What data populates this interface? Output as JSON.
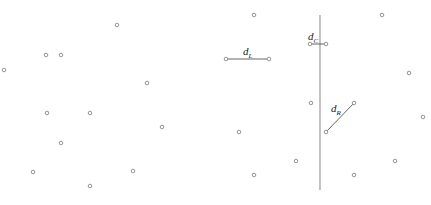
{
  "diagram": {
    "type": "closest-pair-divide-and-conquer",
    "colors": {
      "points": "#8a8a8a",
      "divider": "#9a9a9a",
      "segments": "#555555",
      "labels": "#222222"
    },
    "divider": {
      "x": 320,
      "y1": 15,
      "y2": 190
    },
    "points": [
      {
        "x": 117,
        "y": 25
      },
      {
        "x": 46,
        "y": 55
      },
      {
        "x": 61,
        "y": 55
      },
      {
        "x": 4,
        "y": 70
      },
      {
        "x": 147,
        "y": 83
      },
      {
        "x": 47,
        "y": 113
      },
      {
        "x": 90,
        "y": 113
      },
      {
        "x": 162,
        "y": 127
      },
      {
        "x": 61,
        "y": 143
      },
      {
        "x": 33,
        "y": 172
      },
      {
        "x": 133,
        "y": 171
      },
      {
        "x": 90,
        "y": 186
      },
      {
        "x": 254,
        "y": 15
      },
      {
        "x": 382,
        "y": 15
      },
      {
        "x": 409,
        "y": 73
      },
      {
        "x": 423,
        "y": 117
      },
      {
        "x": 311,
        "y": 103
      },
      {
        "x": 239,
        "y": 132
      },
      {
        "x": 296,
        "y": 161
      },
      {
        "x": 395,
        "y": 161
      },
      {
        "x": 254,
        "y": 175
      },
      {
        "x": 354,
        "y": 175
      }
    ],
    "pairs": [
      {
        "id": "dL",
        "label_main": "d",
        "label_sub": "L",
        "p1": {
          "x": 226,
          "y": 59
        },
        "p2": {
          "x": 269,
          "y": 59
        },
        "label_pos": {
          "x": 243,
          "y": 55
        }
      },
      {
        "id": "dC",
        "label_main": "d",
        "label_sub": "C",
        "p1": {
          "x": 310,
          "y": 44
        },
        "p2": {
          "x": 326,
          "y": 44
        },
        "label_pos": {
          "x": 308,
          "y": 40
        }
      },
      {
        "id": "dR",
        "label_main": "d",
        "label_sub": "R",
        "p1": {
          "x": 326,
          "y": 132
        },
        "p2": {
          "x": 354,
          "y": 103
        },
        "label_pos": {
          "x": 331,
          "y": 112
        }
      }
    ]
  }
}
